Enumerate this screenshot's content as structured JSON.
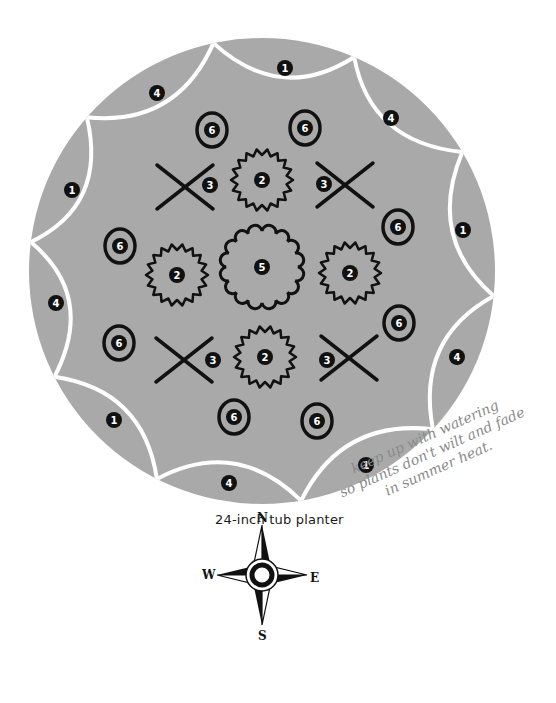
{
  "title": "24-inch tub planter",
  "note": {
    "lines": [
      "keep up with watering",
      "so plants don't wilt and fade",
      "in summer heat."
    ]
  },
  "colors": {
    "planter_fill": "#a9a9a9",
    "boundary": "#ffffff",
    "ink": "#111111",
    "note_ink": "#8a8a8a"
  },
  "compass": {
    "north": "N",
    "south": "S",
    "east": "E",
    "west": "W"
  },
  "planter": {
    "center": [
      262,
      271
    ],
    "radius": 233,
    "outer_sections": [
      {
        "label": "1",
        "x": 285,
        "y": 68
      },
      {
        "label": "4",
        "x": 391,
        "y": 118
      },
      {
        "label": "1",
        "x": 463,
        "y": 230
      },
      {
        "label": "4",
        "x": 457,
        "y": 357
      },
      {
        "label": "1",
        "x": 366,
        "y": 465
      },
      {
        "label": "4",
        "x": 229,
        "y": 483
      },
      {
        "label": "1",
        "x": 114,
        "y": 420
      },
      {
        "label": "4",
        "x": 56,
        "y": 303
      },
      {
        "label": "1",
        "x": 72,
        "y": 190
      },
      {
        "label": "4",
        "x": 157,
        "y": 93
      }
    ],
    "ringed_plants": [
      {
        "label": "6",
        "x": 212,
        "y": 130
      },
      {
        "label": "6",
        "x": 305,
        "y": 128
      },
      {
        "label": "6",
        "x": 398,
        "y": 227
      },
      {
        "label": "6",
        "x": 399,
        "y": 323
      },
      {
        "label": "6",
        "x": 317,
        "y": 421
      },
      {
        "label": "6",
        "x": 234,
        "y": 417
      },
      {
        "label": "6",
        "x": 119,
        "y": 343
      },
      {
        "label": "6",
        "x": 120,
        "y": 246
      }
    ],
    "x_plants": [
      {
        "label": "3",
        "cx": 185,
        "cy": 187,
        "lx": 210,
        "ly": 185
      },
      {
        "label": "3",
        "cx": 345,
        "cy": 185,
        "lx": 324,
        "ly": 184
      },
      {
        "label": "3",
        "cx": 184,
        "cy": 360,
        "lx": 213,
        "ly": 360
      },
      {
        "label": "3",
        "cx": 349,
        "cy": 358,
        "lx": 327,
        "ly": 360
      }
    ],
    "spiky_plants": [
      {
        "label": "2",
        "x": 262,
        "y": 180,
        "r": 30
      },
      {
        "label": "2",
        "x": 177,
        "y": 275,
        "r": 30
      },
      {
        "label": "2",
        "x": 350,
        "y": 273,
        "r": 30
      },
      {
        "label": "2",
        "x": 265,
        "y": 357,
        "r": 30
      }
    ],
    "center_plant": {
      "label": "5",
      "x": 262,
      "y": 267,
      "r": 40
    }
  }
}
